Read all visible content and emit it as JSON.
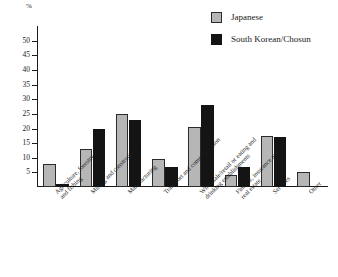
{
  "chart_data": {
    "type": "bar",
    "title": "",
    "xlabel": "",
    "ylabel": "%",
    "ylim": [
      0,
      55
    ],
    "ytick_step": 5,
    "yticks": [
      50,
      45,
      40,
      35,
      30,
      25,
      20,
      15,
      10,
      5
    ],
    "grid": false,
    "legend_position": "top-right",
    "categories": [
      "Agriculture, forestry\nand fishing",
      "Mining and construction",
      "Manufacturing",
      "Transport and communication",
      "Wholesale/retail or eating and\ndrinking establishments",
      "Finance, insurance and\nreal estate",
      "Services",
      "Other"
    ],
    "series": [
      {
        "name": "Japanese",
        "color": "#b6b6b6",
        "values": [
          8,
          13,
          25,
          9.5,
          20.5,
          4,
          17.5,
          5
        ]
      },
      {
        "name": "South Korean/Chosun",
        "color": "#141414",
        "values": [
          1,
          20,
          23,
          7,
          28,
          7,
          17,
          0
        ]
      }
    ]
  },
  "legend": {
    "items": [
      {
        "label": "Japanese",
        "swatch": "japanese"
      },
      {
        "label": "South Korean/Chosun",
        "swatch": "korean"
      }
    ]
  },
  "axis": {
    "unit_label": "%"
  }
}
